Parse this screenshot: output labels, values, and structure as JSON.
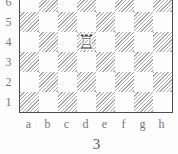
{
  "diagram": {
    "number": "3",
    "board": {
      "rank_labels": [
        "6",
        "5",
        "4",
        "3",
        "2",
        "1"
      ],
      "file_labels": [
        "a",
        "b",
        "c",
        "d",
        "e",
        "f",
        "g",
        "h"
      ],
      "pieces": [
        {
          "piece": "white-rook",
          "square": "d4",
          "glyph": "♖"
        }
      ]
    },
    "colors": {
      "page_bg": "#fdfdfd",
      "light_square": "#fdfdfd",
      "dark_square_hatch": "#ababab",
      "board_border": "#4d4d4d",
      "label_text": "#787878",
      "number_text": "#5a5a5a",
      "piece_color": "#333333"
    }
  }
}
